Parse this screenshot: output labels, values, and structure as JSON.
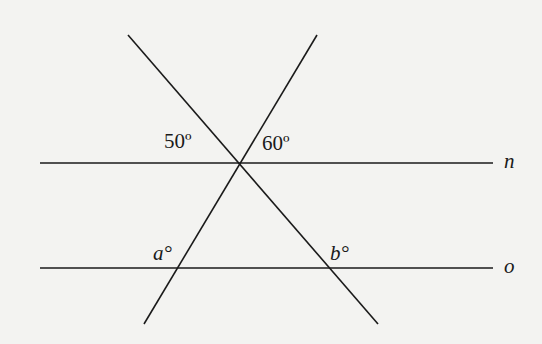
{
  "diagram": {
    "angle_labels": {
      "left_top": "50º",
      "right_top": "60º",
      "a": "a°",
      "b": "b°"
    },
    "line_labels": {
      "n": "n",
      "o": "o"
    },
    "colors": {
      "background": "#f3f3f1",
      "ink": "#1a1a1a"
    }
  }
}
